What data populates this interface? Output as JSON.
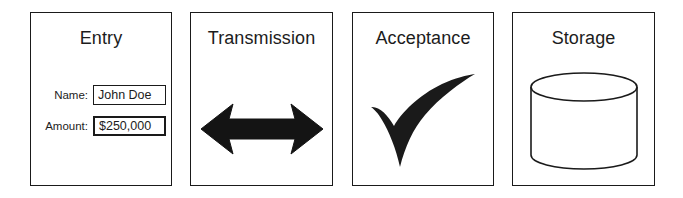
{
  "diagram": {
    "background_color": "#ffffff",
    "stroke_color": "#1a1a1a",
    "text_color": "#1c1c1c",
    "panels": [
      {
        "id": "entry",
        "title": "Entry",
        "icon": "form-icon",
        "fields": [
          {
            "label": "Name:",
            "value": "John Doe"
          },
          {
            "label": "Amount:",
            "value": "$250,000"
          }
        ]
      },
      {
        "id": "transmission",
        "title": "Transmission",
        "icon": "double-headed-arrow-icon"
      },
      {
        "id": "acceptance",
        "title": "Acceptance",
        "icon": "checkmark-icon"
      },
      {
        "id": "storage",
        "title": "Storage",
        "icon": "database-cylinder-icon"
      }
    ]
  }
}
